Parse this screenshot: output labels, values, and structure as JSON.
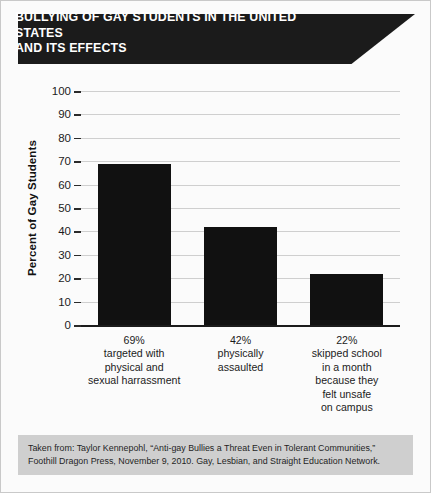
{
  "title": {
    "line1": "BULLYING OF GAY STUDENTS IN THE UNITED STATES",
    "line2": "AND ITS EFFECTS",
    "full": "BULLYING OF GAY STUDENTS IN THE UNITED STATES AND ITS EFFECTS"
  },
  "source": {
    "line1": "Taken from: Taylor Kennepohl, “Anti-gay Bullies a Threat Even in Tolerant Communities,”",
    "line2": "Foothill Dragon Press, November 9, 2010. Gay, Lesbian, and Straight Education Network."
  },
  "colors": {
    "bar": "#111111",
    "banner_bg": "#1b1b1b",
    "banner_text": "#ffffff",
    "grid": "#cfcfcf",
    "axis": "#1b1b1b",
    "source_band": "#cfcfcf",
    "card_bg": "#fbfbfb"
  },
  "chart_data": {
    "type": "bar",
    "title": "BULLYING OF GAY STUDENTS IN THE UNITED STATES AND ITS EFFECTS",
    "xlabel": "",
    "ylabel": "Percent of Gay Students",
    "ylim": [
      0,
      100
    ],
    "ytick_values": [
      0,
      10,
      20,
      30,
      40,
      50,
      60,
      70,
      80,
      90,
      100
    ],
    "ytick_labels": [
      "0",
      "10",
      "20",
      "30",
      "40",
      "50",
      "60",
      "70",
      "80",
      "90",
      "100"
    ],
    "grid": true,
    "legend": false,
    "categories": [
      "69% targeted with physical and sexual harrassment",
      "42% physically assaulted",
      "22% skipped school in a month because they felt unsafe on campus"
    ],
    "category_lines": [
      [
        "69%",
        "targeted with",
        "physical and",
        "sexual harrassment"
      ],
      [
        "42%",
        "physically",
        "assaulted"
      ],
      [
        "22%",
        "skipped school",
        "in a month",
        "because they",
        "felt unsafe",
        "on campus"
      ]
    ],
    "values": [
      69,
      42,
      22
    ]
  }
}
